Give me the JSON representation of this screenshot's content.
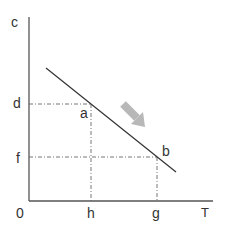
{
  "diagram": {
    "axes": {
      "y_label": "c",
      "x_label": "T",
      "origin_label": "0"
    },
    "y_ticks": [
      "d",
      "f"
    ],
    "x_ticks": [
      "h",
      "g"
    ],
    "points": [
      {
        "label": "a",
        "x_tick": "h",
        "y_tick": "d"
      },
      {
        "label": "b",
        "x_tick": "g",
        "y_tick": "f"
      }
    ],
    "arrow": {
      "direction": "down-right",
      "color": "#b8b8b8"
    },
    "colors": {
      "axis": "#555555",
      "line": "#333333",
      "guide": "#666666"
    }
  },
  "labels": {
    "c": "c",
    "d": "d",
    "f": "f",
    "zero": "0",
    "h": "h",
    "g": "g",
    "T": "T",
    "a": "a",
    "b": "b"
  }
}
